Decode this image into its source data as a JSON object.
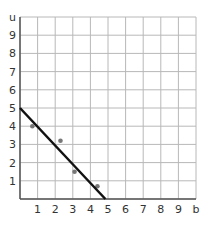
{
  "chart_data": {
    "type": "scatter",
    "title": "",
    "xlabel": "b",
    "ylabel": "u",
    "xlim": [
      0,
      10
    ],
    "ylim": [
      0,
      10
    ],
    "grid": true,
    "x_ticks": [
      "1",
      "2",
      "3",
      "4",
      "5",
      "6",
      "7",
      "8",
      "9"
    ],
    "y_ticks": [
      "1",
      "2",
      "3",
      "4",
      "5",
      "6",
      "7",
      "8",
      "9"
    ],
    "series": [
      {
        "name": "points",
        "type": "scatter",
        "points": [
          {
            "x": 0.7,
            "y": 4.0
          },
          {
            "x": 2.3,
            "y": 3.2
          },
          {
            "x": 3.1,
            "y": 1.5
          },
          {
            "x": 4.4,
            "y": 0.7
          }
        ]
      },
      {
        "name": "line of fit",
        "type": "line",
        "points": [
          {
            "x": 0,
            "y": 5.0
          },
          {
            "x": 4.85,
            "y": 0
          }
        ]
      }
    ]
  },
  "colors": {
    "grid": "#b8b8b8",
    "axis": "#555555",
    "line": "#111111",
    "point": "#777777"
  }
}
